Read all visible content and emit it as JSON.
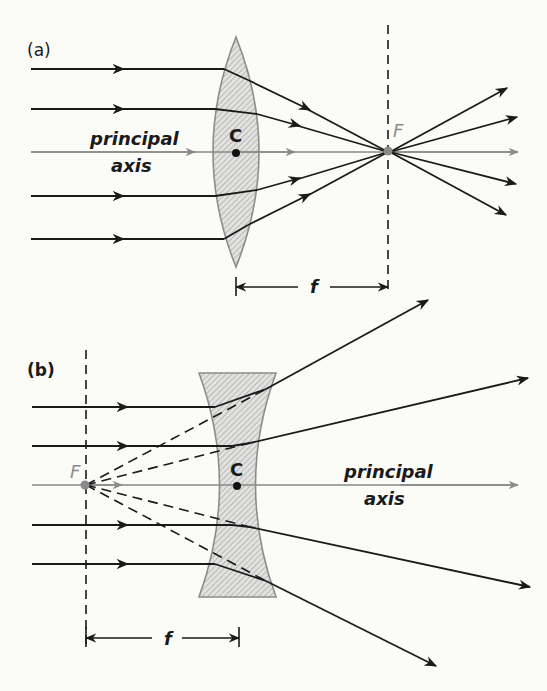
{
  "colors": {
    "background": "#fbfbf8",
    "ray": "#1a1a1a",
    "axis": "#8a8a8a",
    "lens_fill": "#d8d8d8",
    "lens_edge": "#8c8c8c",
    "focus_point": "#8a8a8a"
  },
  "panel_a": {
    "label": "(a)",
    "lens_type": "converging (convex)",
    "center_label": "C",
    "focus_label": "F",
    "axis_label_line1": "principal",
    "axis_label_line2": "axis",
    "focal_length_label": "f"
  },
  "panel_b": {
    "label": "(b)",
    "lens_type": "diverging (concave)",
    "center_label": "C",
    "focus_label": "F",
    "axis_label_line1": "principal",
    "axis_label_line2": "axis",
    "focal_length_label": "f"
  }
}
